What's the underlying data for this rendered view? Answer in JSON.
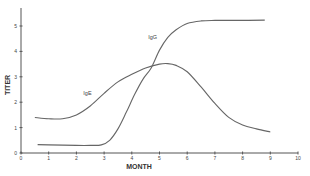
{
  "chart_data": {
    "type": "line",
    "title": "",
    "xlabel": "MONTH",
    "ylabel": "TITER",
    "xlim": [
      0,
      10
    ],
    "ylim": [
      0,
      5.8
    ],
    "xticks": [
      0,
      1,
      2,
      3,
      4,
      5,
      6,
      7,
      8,
      9,
      10
    ],
    "yticks": [
      0,
      1,
      2,
      3,
      4,
      5
    ],
    "grid": false,
    "legend": "inline labels",
    "series": [
      {
        "name": "IgE",
        "label_pos": [
          2.4,
          2.3
        ],
        "x": [
          0.5,
          1.0,
          1.5,
          2.0,
          2.5,
          3.0,
          3.5,
          4.0,
          4.5,
          5.0,
          5.3,
          5.6,
          6.0,
          6.5,
          7.0,
          7.5,
          8.0,
          8.5,
          9.0
        ],
        "y": [
          1.4,
          1.35,
          1.35,
          1.5,
          1.85,
          2.35,
          2.8,
          3.1,
          3.35,
          3.5,
          3.52,
          3.45,
          3.2,
          2.6,
          1.95,
          1.4,
          1.1,
          0.95,
          0.83
        ]
      },
      {
        "name": "IgG",
        "label_pos": [
          4.75,
          4.5
        ],
        "x": [
          0.6,
          1.0,
          2.0,
          2.5,
          2.9,
          3.2,
          3.5,
          3.8,
          4.1,
          4.4,
          4.7,
          5.0,
          5.3,
          5.6,
          6.0,
          6.5,
          7.0,
          8.0,
          8.8
        ],
        "y": [
          0.33,
          0.32,
          0.3,
          0.3,
          0.32,
          0.5,
          0.95,
          1.6,
          2.3,
          2.9,
          3.35,
          4.05,
          4.55,
          4.85,
          5.1,
          5.2,
          5.22,
          5.22,
          5.23
        ]
      }
    ]
  }
}
